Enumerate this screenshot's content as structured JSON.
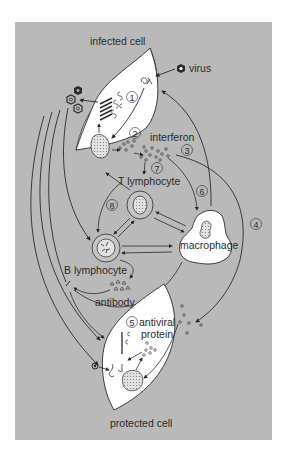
{
  "colors": {
    "background": "#b9b9b9",
    "page": "#ffffff",
    "cell_fill": "#ffffff",
    "stroke": "#2a2a2a",
    "nucleus_fill": "#cfcfcf"
  },
  "labels": {
    "infected_cell": "infected cell",
    "virus": "virus",
    "interferon": "interferon",
    "t_lymphocyte": "T lymphocyte",
    "macrophage": "macrophage",
    "b_lymphocyte": "B lymphocyte",
    "antibody": "antibody",
    "antiviral": "antiviral",
    "protein": "protein",
    "protected_cell": "protected cell"
  },
  "steps": {
    "s1": "1",
    "s2": "2",
    "s3": "3",
    "s4": "4",
    "s5": "5",
    "s6": "6",
    "s7": "7",
    "s8": "8"
  }
}
